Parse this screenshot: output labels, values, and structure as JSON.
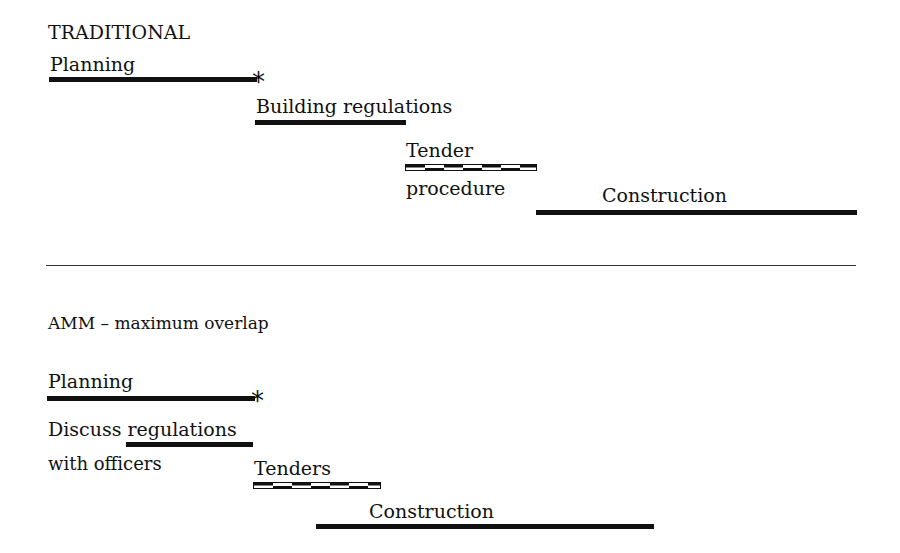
{
  "traditional": {
    "title": "TRADITIONAL",
    "planning": "Planning",
    "milestone": "*",
    "building_regulations": "Building regulations",
    "tender_top": "Tender",
    "tender_bottom": "procedure",
    "construction": "Construction"
  },
  "amm": {
    "title": "AMM – maximum overlap",
    "planning": "Planning",
    "milestone": "*",
    "discuss_line1": "Discuss regulations",
    "discuss_line2": "with officers",
    "tenders": "Tenders",
    "construction": "Construction"
  },
  "colors": {
    "ink": "#111111",
    "background": "#ffffff"
  }
}
